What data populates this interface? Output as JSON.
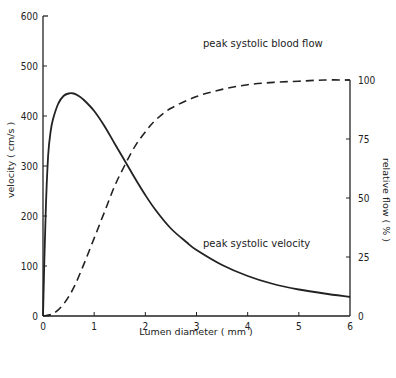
{
  "chart_data": {
    "type": "line",
    "title": "",
    "xlabel": "Lumen  diameter  ( mm )",
    "ylabel": "velocity  ( cm/s )",
    "y2label": "relative  flow  ( % )",
    "xlim": [
      0,
      6
    ],
    "ylim": [
      0,
      600
    ],
    "y2lim": [
      0,
      100
    ],
    "x_ticks": [
      "0",
      "1",
      "2",
      "3",
      "4",
      "5",
      "6"
    ],
    "y_ticks": [
      "0",
      "100",
      "200",
      "300",
      "400",
      "500",
      "600"
    ],
    "y2_ticks": [
      "0",
      "25",
      "50",
      "75",
      "100"
    ],
    "grid": false,
    "legend": "none (inline annotations)",
    "series": [
      {
        "name": "peak systolic velocity",
        "axis": "left",
        "style": "solid",
        "x": [
          0,
          0.05,
          0.1,
          0.15,
          0.2,
          0.3,
          0.4,
          0.5,
          0.6,
          0.7,
          0.8,
          1.0,
          1.2,
          1.4,
          1.6,
          1.8,
          2.0,
          2.2,
          2.5,
          2.8,
          3.0,
          3.5,
          4.0,
          4.5,
          5.0,
          5.5,
          6.0
        ],
        "values": [
          0,
          200,
          320,
          370,
          395,
          425,
          440,
          445,
          445,
          440,
          432,
          410,
          380,
          345,
          310,
          275,
          242,
          212,
          175,
          148,
          132,
          102,
          80,
          64,
          53,
          45,
          38
        ]
      },
      {
        "name": "peak systolic blood flow",
        "axis": "right",
        "style": "dashed",
        "x": [
          0,
          0.2,
          0.4,
          0.6,
          0.8,
          1.0,
          1.2,
          1.4,
          1.6,
          1.8,
          2.0,
          2.2,
          2.5,
          3.0,
          3.5,
          4.0,
          4.5,
          5.0,
          5.5,
          6.0
        ],
        "values": [
          0,
          1,
          5,
          12,
          22,
          33,
          44,
          55,
          64,
          72,
          78,
          83,
          88,
          93,
          96,
          98,
          99,
          99.5,
          100,
          100
        ]
      }
    ],
    "annotations": [
      {
        "text": "peak systolic blood flow",
        "x": 3.25,
        "y_right": 103
      },
      {
        "text": "peak systolic velocity",
        "x": 3.1,
        "y_left": 160
      }
    ]
  },
  "labels": {
    "xlabel": "Lumen  diameter  ( mm )",
    "ylabel": "velocity  ( cm/s )",
    "y2label": "relative  flow  ( % )",
    "flow_annotation": "peak systolic blood flow",
    "velocity_annotation": "peak systolic velocity"
  },
  "colors": {
    "ink": "#222222",
    "background": "#ffffff"
  }
}
